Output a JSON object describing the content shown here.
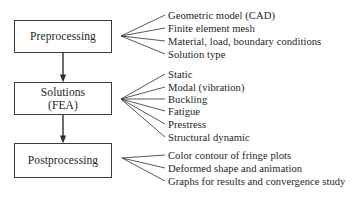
{
  "diagram": {
    "line_color": "#3b3b3b",
    "text_color": "#231f20",
    "background": "#ffffff",
    "stages": [
      {
        "id": "preprocessing",
        "label": "Preprocessing",
        "items": [
          "Geometric model (CAD)",
          "Finite element mesh",
          "Material, load, boundary conditions",
          "Solution type"
        ]
      },
      {
        "id": "solutions",
        "label": "Solutions\n(FEA)",
        "items": [
          "Static",
          "Modal (vibration)",
          "Buckling",
          "Fatigue",
          "Prestress",
          "Structural dynamic"
        ]
      },
      {
        "id": "postprocessing",
        "label": "Postprocessing",
        "items": [
          "Color contour of fringe plots",
          "Deformed shape and animation",
          "Graphs for results and convergence study"
        ]
      }
    ],
    "connectors": [
      {
        "from": "preprocessing",
        "to": "solutions",
        "type": "arrow-down"
      },
      {
        "from": "solutions",
        "to": "postprocessing",
        "type": "arrow-down"
      }
    ]
  }
}
